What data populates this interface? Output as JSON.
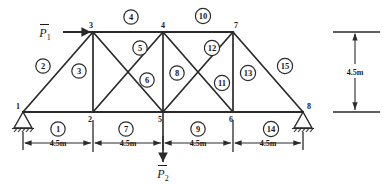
{
  "figure": {
    "geometry": {
      "top_chord_y": 32,
      "bottom_chord_y": 112,
      "panel_width_label": "4.5m",
      "height_label": "4.5m"
    }
  },
  "nodes": [
    {
      "id": "1",
      "label": "1",
      "x": 23,
      "y": 112,
      "label_x": 18,
      "label_y": 109
    },
    {
      "id": "2",
      "label": "2",
      "x": 93,
      "y": 112,
      "label_x": 90,
      "label_y": 122
    },
    {
      "id": "3",
      "label": "3",
      "x": 93,
      "y": 32,
      "label_x": 91,
      "label_y": 28
    },
    {
      "id": "4",
      "label": "4",
      "x": 163,
      "y": 32,
      "label_x": 163,
      "label_y": 28
    },
    {
      "id": "5",
      "label": "5",
      "x": 163,
      "y": 112,
      "label_x": 160,
      "label_y": 122
    },
    {
      "id": "6",
      "label": "6",
      "x": 233,
      "y": 112,
      "label_x": 231,
      "label_y": 122
    },
    {
      "id": "7",
      "label": "7",
      "x": 233,
      "y": 32,
      "label_x": 236,
      "label_y": 28
    },
    {
      "id": "8",
      "label": "8",
      "x": 303,
      "y": 112,
      "label_x": 309,
      "label_y": 109
    }
  ],
  "members": [
    {
      "id": "1",
      "label": "1",
      "from": "1",
      "to": "2",
      "circle_x": 58,
      "circle_y": 129
    },
    {
      "id": "2",
      "label": "2",
      "from": "1",
      "to": "3",
      "circle_x": 43,
      "circle_y": 66
    },
    {
      "id": "3",
      "label": "3",
      "from": "2",
      "to": "3",
      "circle_x": 79,
      "circle_y": 71
    },
    {
      "id": "4",
      "label": "4",
      "from": "3",
      "to": "4",
      "circle_x": 131,
      "circle_y": 17
    },
    {
      "id": "5",
      "label": "5",
      "from": "3",
      "to": "5",
      "circle_x": 140,
      "circle_y": 48
    },
    {
      "id": "6",
      "label": "6",
      "from": "2",
      "to": "4",
      "circle_x": 147,
      "circle_y": 80
    },
    {
      "id": "7",
      "label": "7",
      "from": "2",
      "to": "5",
      "circle_x": 126,
      "circle_y": 129
    },
    {
      "id": "8",
      "label": "8",
      "from": "4",
      "to": "5",
      "circle_x": 177,
      "circle_y": 73
    },
    {
      "id": "9",
      "label": "9",
      "from": "5",
      "to": "6",
      "circle_x": 198,
      "circle_y": 129
    },
    {
      "id": "10",
      "label": "10",
      "from": "4",
      "to": "7",
      "circle_x": 203,
      "circle_y": 16
    },
    {
      "id": "11",
      "label": "11",
      "from": "4",
      "to": "6",
      "circle_x": 222,
      "circle_y": 83
    },
    {
      "id": "12",
      "label": "12",
      "from": "5",
      "to": "7",
      "circle_x": 212,
      "circle_y": 48
    },
    {
      "id": "13",
      "label": "13",
      "from": "6",
      "to": "7",
      "circle_x": 248,
      "circle_y": 73
    },
    {
      "id": "14",
      "label": "14",
      "from": "6",
      "to": "8",
      "circle_x": 271,
      "circle_y": 129
    },
    {
      "id": "15",
      "label": "15",
      "from": "7",
      "to": "8",
      "circle_x": 285,
      "circle_y": 66
    }
  ],
  "loads": [
    {
      "id": "P1",
      "symbol": "P",
      "subscript": "1",
      "text_x": 45,
      "text_y": 40,
      "direction": "right",
      "applied_to": "3"
    },
    {
      "id": "P2",
      "symbol": "P",
      "subscript": "2",
      "text_x": 163,
      "text_y": 176,
      "direction": "down",
      "applied_to": "5"
    }
  ],
  "dimensions": {
    "horizontal": [
      {
        "label": "4.5m",
        "x1": 23,
        "x2": 93,
        "text_x": 58,
        "text_y": 147,
        "y": 143
      },
      {
        "label": "4.5m",
        "x1": 93,
        "x2": 163,
        "text_x": 128,
        "text_y": 147,
        "y": 143
      },
      {
        "label": "4.5m",
        "x1": 163,
        "x2": 233,
        "text_x": 198,
        "text_y": 147,
        "y": 143
      },
      {
        "label": "4.5m",
        "x1": 233,
        "x2": 303,
        "text_x": 268,
        "text_y": 147,
        "y": 143
      }
    ],
    "vertical": [
      {
        "label": "4.5m",
        "y1": 32,
        "y2": 112,
        "x": 355,
        "text_x": 355,
        "text_y": 75
      }
    ]
  },
  "supports": [
    {
      "node": "1",
      "type": "pin-support",
      "x": 23,
      "y": 112
    },
    {
      "node": "8",
      "type": "pin-support",
      "x": 303,
      "y": 112
    }
  ],
  "colors": {
    "line": "#2a2a2a",
    "text": "#1a1a1a",
    "background": "#ffffff"
  }
}
